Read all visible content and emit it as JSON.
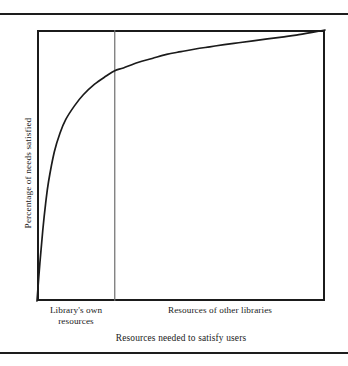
{
  "figure": {
    "name": "library-resources-diminishing-returns-figure",
    "background_color": "#ffffff",
    "ink_color": "#1b1b1b"
  },
  "chart_data": {
    "type": "line",
    "title": "",
    "subtitle": "",
    "xlabel": "Resources needed to satisfy users",
    "ylabel": "Percentage of needs satisfied",
    "grid": false,
    "legend": "none",
    "xlim": [
      0,
      100
    ],
    "ylim": [
      0,
      100
    ],
    "axis_tick_labels": {
      "x": [],
      "y": []
    },
    "series": [
      {
        "name": "Percentage of needs satisfied",
        "style": "solid",
        "color": "#1b1b1b",
        "description": "Steeply rising concave curve showing diminishing returns: needs satisfied climbs very rapidly with the first increments of resources, then flattens asymptotically toward 100%.",
        "x": [
          0,
          1,
          2,
          3,
          4,
          6,
          8,
          10,
          13,
          16,
          20,
          24,
          27,
          30,
          35,
          40,
          45,
          50,
          55,
          60,
          65,
          70,
          75,
          80,
          85,
          90,
          95,
          100
        ],
        "y": [
          0,
          14,
          26,
          36,
          44,
          55,
          62,
          67,
          72,
          76,
          80,
          83,
          85,
          86,
          88,
          89.5,
          91,
          92,
          93,
          93.8,
          94.6,
          95.3,
          96,
          96.7,
          97.4,
          98.1,
          99,
          100
        ]
      }
    ],
    "annotations": [
      {
        "type": "vertical-divider",
        "name": "segment-boundary",
        "x": 27,
        "color": "#6e6e6e",
        "description": "Vertical rule separating the library's own resources from resources of other libraries."
      }
    ],
    "segments": [
      {
        "name": "library-own-resources",
        "label_line1": "Library's own",
        "label_line2": "resources",
        "x_range": [
          0,
          27
        ]
      },
      {
        "name": "resources-other-libraries",
        "label_line1": "Resources of other libraries",
        "label_line2": "",
        "x_range": [
          27,
          100
        ]
      }
    ]
  },
  "axis": {
    "y_title": "Percentage of needs satisfied",
    "x_title": "Resources needed to satisfy users"
  },
  "labels": {
    "own_resources_line1": "Library's own",
    "own_resources_line2": "resources",
    "other_libraries": "Resources of other libraries"
  },
  "rules": {
    "top_rule": "",
    "bottom_rule": ""
  }
}
